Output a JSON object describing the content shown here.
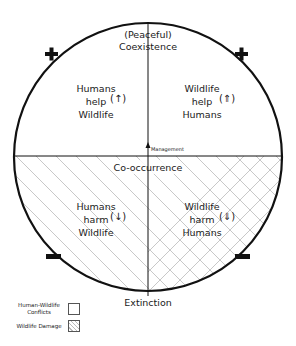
{
  "diagram": {
    "top_label": [
      "(Peaceful)",
      "Coexistence"
    ],
    "middle_label": "Co-occurrence",
    "bottom_label": "Extinction",
    "management_label": "Management",
    "quadrants": {
      "top_left": {
        "lines": [
          "Humans",
          "help",
          "Wildlife"
        ],
        "arrow": "up",
        "arrow_glyph": "(↑)"
      },
      "top_right": {
        "lines": [
          "Wildlife",
          "help",
          "Humans"
        ],
        "arrow": "up-bold",
        "arrow_glyph": "(⇑)"
      },
      "bottom_left": {
        "lines": [
          "Humans",
          "harm",
          "Wildlife"
        ],
        "arrow": "down",
        "arrow_glyph": "(↓)",
        "pattern": "single-diagonal-hatch"
      },
      "bottom_right": {
        "lines": [
          "Wildlife",
          "harm",
          "Humans"
        ],
        "arrow": "down-bold",
        "arrow_glyph": "(⇓)",
        "pattern": "cross-hatch"
      }
    },
    "signs": {
      "top_left": "+",
      "top_right": "+",
      "bottom_left": "−",
      "bottom_right": "−"
    },
    "colors": {
      "stroke": "#111111",
      "hatch": "#c8c8c8",
      "background": "#ffffff"
    }
  },
  "legend": {
    "items": [
      {
        "label_lines": [
          "Human-Wildlife",
          "Conflicts"
        ],
        "swatch": "empty"
      },
      {
        "label_lines": [
          "Wildlife Damage"
        ],
        "swatch": "hatched"
      }
    ]
  }
}
